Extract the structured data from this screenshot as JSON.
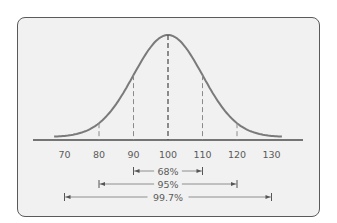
{
  "chart_data": {
    "type": "line",
    "title": "",
    "xlabel": "",
    "ylabel": "",
    "x_ticks": [
      "70",
      "80",
      "90",
      "100",
      "110",
      "120",
      "130"
    ],
    "mean": 100,
    "sd": 10,
    "dashed_lines_at": [
      80,
      90,
      100,
      110,
      120
    ],
    "intervals": [
      {
        "label": "68%",
        "from": 90,
        "to": 110
      },
      {
        "label": "95%",
        "from": 80,
        "to": 120
      },
      {
        "label": "99.7%",
        "from": 70,
        "to": 130
      }
    ],
    "grid": false,
    "legend": false
  },
  "colors": {
    "curve": "#7a7a7a",
    "axis": "#4a4a4a",
    "text": "#5a5a5a",
    "background": "#f1f1f1",
    "border": "#5a5a5a"
  }
}
